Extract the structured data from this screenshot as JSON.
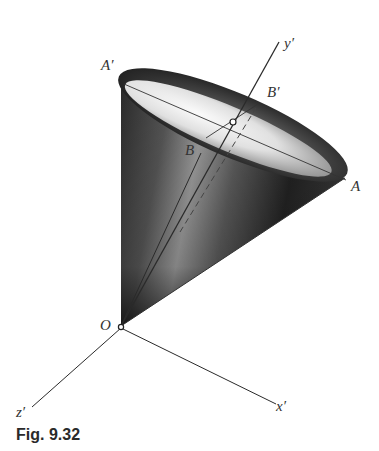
{
  "figure": {
    "caption": "Fig. 9.32",
    "labels": {
      "A_prime": "A′",
      "B_prime": "B′",
      "B": "B",
      "A": "A",
      "y_prime": "y′",
      "O": "O",
      "z_prime": "z′",
      "x_prime": "x′"
    },
    "colors": {
      "ink": "#2a2a2a",
      "shade_dark": "#1a1a1a",
      "shade_light": "#f2f2f2"
    }
  }
}
